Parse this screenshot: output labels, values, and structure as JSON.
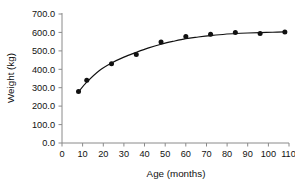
{
  "chart_data": {
    "type": "scatter",
    "title": "",
    "xlabel": "Age (months)",
    "ylabel": "Weight (kg)",
    "xlim": [
      0,
      110
    ],
    "ylim": [
      0,
      700
    ],
    "grid": false,
    "legend": null,
    "x_ticks": [
      "0",
      "10",
      "20",
      "30",
      "40",
      "50",
      "60",
      "70",
      "80",
      "90",
      "100",
      "110"
    ],
    "x_tick_values": [
      0,
      10,
      20,
      30,
      40,
      50,
      60,
      70,
      80,
      90,
      100,
      110
    ],
    "y_ticks": [
      "0.0",
      "100.0",
      "200.0",
      "300.0",
      "400.0",
      "500.0",
      "600.0",
      "700.0"
    ],
    "y_tick_values": [
      0,
      100,
      200,
      300,
      400,
      500,
      600,
      700
    ],
    "series": [
      {
        "name": "Weight",
        "marker": "filled-circle",
        "marker_color": "#111111",
        "line_color": "#111111",
        "x": [
          8,
          12,
          24,
          36,
          48,
          60,
          72,
          84,
          96,
          108
        ],
        "values": [
          280,
          340,
          430,
          480,
          548,
          578,
          590,
          600,
          594,
          602
        ]
      }
    ],
    "fit_curve": {
      "name": "smoothed-growth-curve",
      "x": [
        8,
        12,
        18,
        24,
        30,
        36,
        42,
        48,
        54,
        60,
        66,
        72,
        78,
        84,
        90,
        96,
        102,
        108
      ],
      "values": [
        278,
        330,
        392,
        434,
        466,
        492,
        516,
        536,
        552,
        566,
        575,
        583,
        589,
        594,
        597,
        599,
        601,
        603
      ]
    }
  },
  "axes": {
    "x_title": "Age (months)",
    "y_title": "Weight (kg)"
  }
}
